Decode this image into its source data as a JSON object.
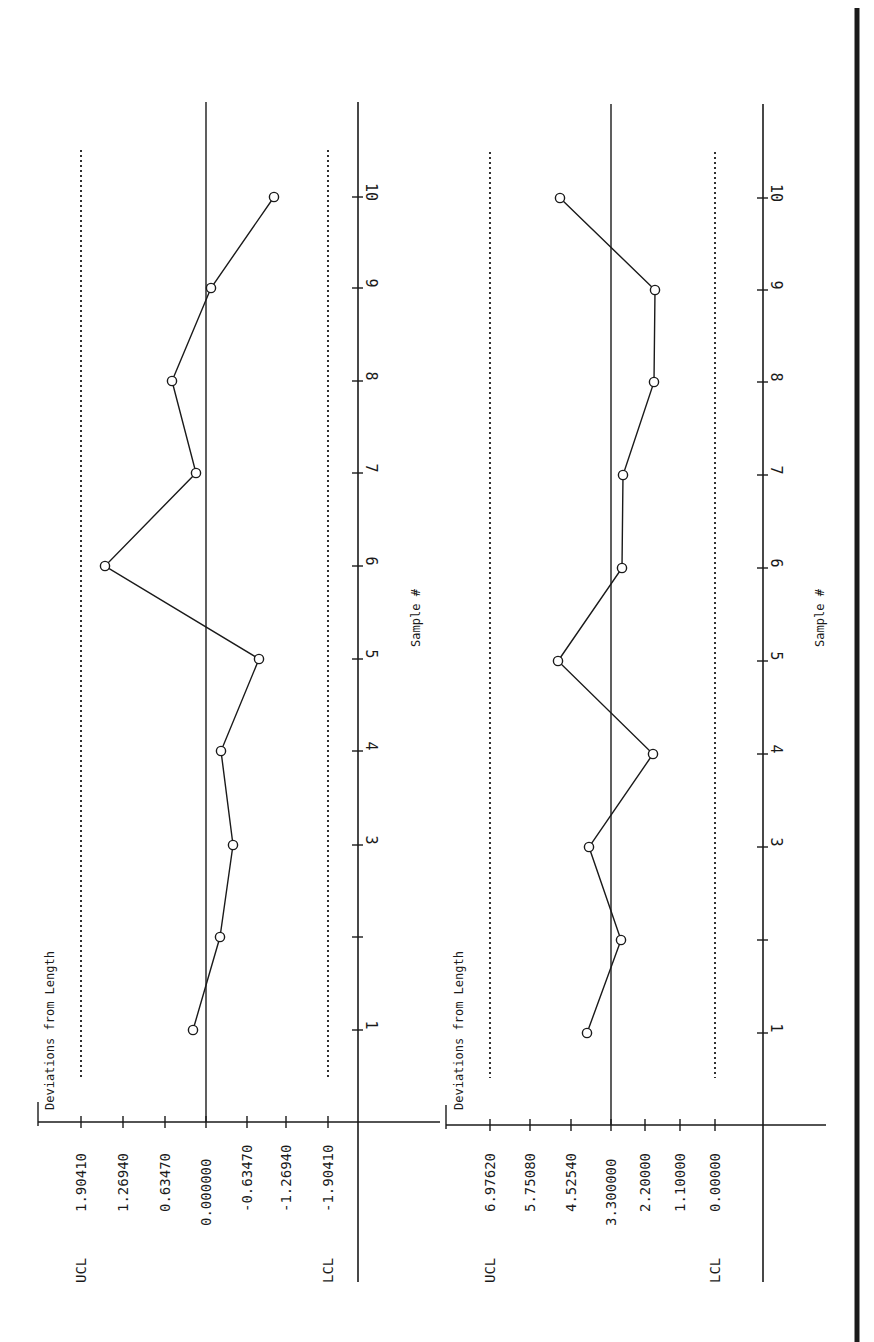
{
  "page": {
    "background": "#ffffff",
    "ink": "#1a1a1a",
    "orientation": "rotated-90-clockwise"
  },
  "chart_data": [
    {
      "type": "line",
      "title": "Deviations from Length",
      "xlabel": "Sample #",
      "ylabel": "",
      "x": [
        1,
        2,
        3,
        4,
        5,
        6,
        7,
        8,
        9,
        10
      ],
      "x_tick_labels": [
        "1",
        "",
        "3",
        "4",
        "5",
        "6",
        "7",
        "8",
        "9",
        "10"
      ],
      "series": [
        {
          "name": "Deviation",
          "marker": "circle",
          "values": [
            0.2,
            -0.22,
            -0.42,
            -0.23,
            -0.82,
            1.56,
            0.15,
            0.52,
            -0.08,
            -1.05
          ]
        }
      ],
      "y_ticks": [
        1.9041,
        1.2694,
        0.6347,
        0.0,
        -0.6347,
        -1.2694,
        -1.9041
      ],
      "y_tick_labels": [
        "1.90410",
        "1.26940",
        "0.63470",
        "0.000000",
        "-0.63470",
        "-1.26940",
        "-1.90410"
      ],
      "center_line": 0.0,
      "ucl": 1.9041,
      "lcl": -1.9041,
      "ucl_label": "UCL",
      "lcl_label": "LCL",
      "ylim": [
        -1.9041,
        1.9041
      ],
      "grid": false,
      "legend": "none"
    },
    {
      "type": "line",
      "title": "Deviations from Length",
      "xlabel": "Sample #",
      "ylabel": "",
      "x": [
        1,
        2,
        3,
        4,
        5,
        6,
        7,
        8,
        9,
        10
      ],
      "x_tick_labels": [
        "1",
        "",
        "3",
        "4",
        "5",
        "6",
        "7",
        "8",
        "9",
        "10"
      ],
      "series": [
        {
          "name": "Range",
          "marker": "circle",
          "values": [
            4.04,
            2.99,
            3.98,
            2.0,
            4.94,
            2.96,
            2.93,
            1.97,
            1.94,
            4.88
          ]
        }
      ],
      "y_ticks": [
        6.9762,
        5.7508,
        4.5254,
        3.3,
        2.2,
        1.1,
        0.0
      ],
      "y_tick_labels": [
        "6.97620",
        "5.75080",
        "4.52540",
        "3.300000",
        "2.20000",
        "1.10000",
        "0.00000"
      ],
      "center_line": 3.3,
      "ucl": 6.9762,
      "lcl": 0.0,
      "ucl_label": "UCL",
      "lcl_label": "LCL",
      "ylim": [
        0.0,
        6.9762
      ],
      "grid": false,
      "legend": "none"
    }
  ],
  "layout": {
    "panels": [
      {
        "value_axis_y": 1122,
        "sample_axis_x": 358,
        "tick_x": [
          81,
          123,
          165,
          206,
          247,
          286,
          328
        ],
        "sample_y": [
          1030,
          937,
          845,
          751,
          659,
          566,
          473,
          381,
          288,
          197
        ],
        "point_x": [
          193,
          220,
          233,
          221,
          259,
          105,
          196,
          172,
          211,
          274
        ],
        "title_x": 46,
        "title_y": 1110,
        "xlabel_x": 420,
        "xlabel_y": 618,
        "center_x": 206,
        "ucl_x": 81,
        "lcl_x": 328,
        "axis_left": 38,
        "axis_right": 440,
        "axis_top": 102,
        "limit_top": 150,
        "limit_bottom": 1078
      },
      {
        "value_axis_y": 1125,
        "sample_axis_x": 763,
        "tick_x": [
          490,
          530,
          571,
          611,
          645,
          680,
          715
        ],
        "sample_y": [
          1033,
          940,
          847,
          754,
          661,
          568,
          475,
          382,
          290,
          198
        ],
        "point_x": [
          587,
          621,
          589,
          653,
          558,
          622,
          623,
          654,
          655,
          560
        ],
        "title_x": 455,
        "title_y": 1110,
        "xlabel_x": 824,
        "xlabel_y": 618,
        "center_x": 611,
        "ucl_x": 490,
        "lcl_x": 715,
        "axis_left": 446,
        "axis_right": 826,
        "axis_top": 104,
        "limit_top": 152,
        "limit_bottom": 1078
      }
    ],
    "border_x": 857
  }
}
